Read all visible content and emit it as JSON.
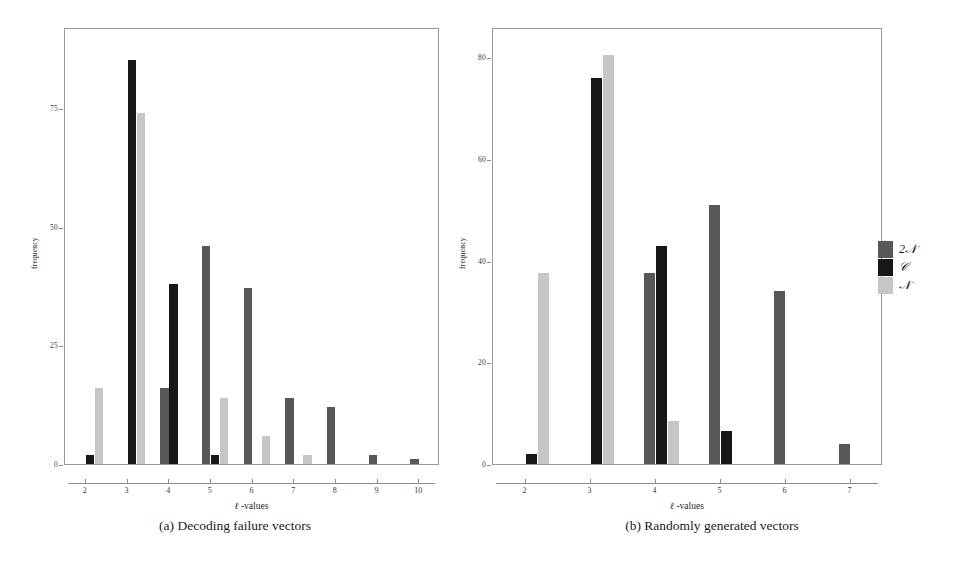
{
  "figure": {
    "legend": {
      "position": "right",
      "entries": [
        {
          "label": "2N",
          "display": "2𝒩",
          "color": "#585858",
          "icon": "legend-swatch"
        },
        {
          "label": "C",
          "display": "𝒞",
          "color": "#171717",
          "icon": "legend-swatch"
        },
        {
          "label": "N",
          "display": "𝒩",
          "color": "#c6c6c6",
          "icon": "legend-swatch"
        }
      ]
    },
    "captions": {
      "a": "(a) Decoding failure vectors",
      "b": "(b) Randomly generated vectors"
    }
  },
  "chart_data": [
    {
      "id": "a",
      "type": "bar",
      "title": "",
      "caption": "(a) Decoding failure vectors",
      "xlabel": "ℓ -values",
      "ylabel": "frequency",
      "categories": [
        2,
        3,
        4,
        5,
        6,
        7,
        8,
        9,
        10
      ],
      "xtick_labels": [
        "2",
        "3",
        "4",
        "5",
        "6",
        "7",
        "8",
        "9",
        "10"
      ],
      "ytick_labels": [
        "0",
        "25",
        "50",
        "75"
      ],
      "yticks": [
        0,
        25,
        50,
        75
      ],
      "ylim": [
        0,
        92
      ],
      "xlim": [
        1.5,
        10.5
      ],
      "grid": false,
      "legend_position": "right",
      "series": [
        {
          "name": "2𝒩",
          "color": "#585858",
          "values": [
            0,
            0,
            16,
            46,
            37,
            14,
            12,
            2,
            1
          ]
        },
        {
          "name": "𝒞",
          "color": "#171717",
          "values": [
            2,
            85,
            38,
            2,
            0,
            0,
            0,
            0,
            0
          ]
        },
        {
          "name": "𝒩",
          "color": "#c6c6c6",
          "values": [
            16,
            74,
            0,
            14,
            6,
            2,
            0,
            0,
            0
          ]
        }
      ]
    },
    {
      "id": "b",
      "type": "bar",
      "title": "",
      "caption": "(b) Randomly generated vectors",
      "xlabel": "ℓ -values",
      "ylabel": "frequency",
      "categories": [
        2,
        3,
        4,
        5,
        6,
        7
      ],
      "xtick_labels": [
        "2",
        "3",
        "4",
        "5",
        "6",
        "7"
      ],
      "ytick_labels": [
        "0",
        "20",
        "40",
        "60",
        "80"
      ],
      "yticks": [
        0,
        20,
        40,
        60,
        80
      ],
      "ylim": [
        0,
        86
      ],
      "xlim": [
        1.5,
        7.5
      ],
      "grid": false,
      "legend_position": "right",
      "series": [
        {
          "name": "2𝒩",
          "color": "#585858",
          "values": [
            0,
            0,
            37.5,
            51,
            34,
            4
          ]
        },
        {
          "name": "𝒞",
          "color": "#171717",
          "values": [
            2,
            76,
            43,
            6.5,
            0,
            0
          ]
        },
        {
          "name": "𝒩",
          "color": "#c6c6c6",
          "values": [
            37.5,
            80.5,
            8.5,
            0,
            0,
            0
          ]
        }
      ]
    }
  ]
}
